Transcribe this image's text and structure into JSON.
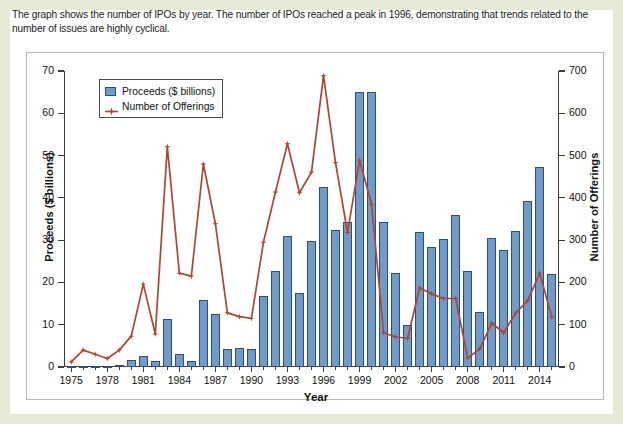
{
  "caption": "The graph shows the number of IPOs by year. The number of IPOs reached a peak in 1996, demonstrating that trends related to the number of issues are highly cyclical.",
  "colors": {
    "bar_fill": "#6f9ac9",
    "bar_stroke": "#2b4f7e",
    "line": "#b1462f",
    "frame_green": "#e4ead5",
    "axis": "#3a3a3a"
  },
  "legend": {
    "position": "top-left-inside",
    "items": [
      {
        "label": "Proceeds ($ billions)",
        "marker": "square-swatch",
        "color": "#6f9ac9"
      },
      {
        "label": "Number of Offerings",
        "marker": "line-with-star",
        "color": "#b1462f"
      }
    ]
  },
  "chart_data": {
    "type": "bar",
    "title": "",
    "subtitle": "",
    "xlabel": "Year",
    "ylabel": "Proceeds ($ billions)",
    "y2label": "Number of Offerings",
    "ylim": [
      0,
      70
    ],
    "y2lim": [
      0,
      700
    ],
    "yticks": [
      0,
      10,
      20,
      30,
      40,
      50,
      60,
      70
    ],
    "y2ticks": [
      0,
      100,
      200,
      300,
      400,
      500,
      600,
      700
    ],
    "xticks": [
      1975,
      1978,
      1981,
      1984,
      1987,
      1990,
      1993,
      1996,
      1999,
      2002,
      2005,
      2008,
      2011,
      2014
    ],
    "xlim": [
      1974.4,
      2015.6
    ],
    "grid": false,
    "legend_position": "upper left",
    "categories": [
      1975,
      1976,
      1977,
      1978,
      1979,
      1980,
      1981,
      1982,
      1983,
      1984,
      1985,
      1986,
      1987,
      1988,
      1989,
      1990,
      1991,
      1992,
      1993,
      1994,
      1995,
      1996,
      1997,
      1998,
      1999,
      2000,
      2001,
      2002,
      2003,
      2004,
      2005,
      2006,
      2007,
      2008,
      2009,
      2010,
      2011,
      2012,
      2013,
      2014,
      2015
    ],
    "series": [
      {
        "name": "Proceeds ($ billions)",
        "axis": "left",
        "kind": "bar",
        "unit": "$ billions",
        "values": [
          0.2,
          0.2,
          0.2,
          0.3,
          0.5,
          1.6,
          2.5,
          1.4,
          11.3,
          3.0,
          1.5,
          15.8,
          12.6,
          4.3,
          4.6,
          4.2,
          16.7,
          22.8,
          31.0,
          17.6,
          29.9,
          42.6,
          32.5,
          34.4,
          65.0,
          65.0,
          34.2,
          22.2,
          9.9,
          32.0,
          28.4,
          30.2,
          35.9,
          22.8,
          13.1,
          30.4,
          27.7,
          32.2,
          39.3,
          47.2,
          21.9
        ]
      },
      {
        "name": "Number of Offerings",
        "axis": "right",
        "kind": "line",
        "unit": "offerings",
        "values": [
          12,
          40,
          30,
          20,
          40,
          73,
          196,
          78,
          521,
          222,
          215,
          480,
          339,
          128,
          119,
          115,
          295,
          414,
          528,
          412,
          461,
          689,
          483,
          318,
          489,
          385,
          81,
          71,
          68,
          187,
          173,
          162,
          162,
          21,
          43,
          104,
          81,
          128,
          157,
          222,
          118
        ]
      }
    ],
    "annotations": [
      {
        "text": "peak in 1996",
        "year": 1996,
        "value": 689,
        "series": "Number of Offerings"
      }
    ]
  }
}
